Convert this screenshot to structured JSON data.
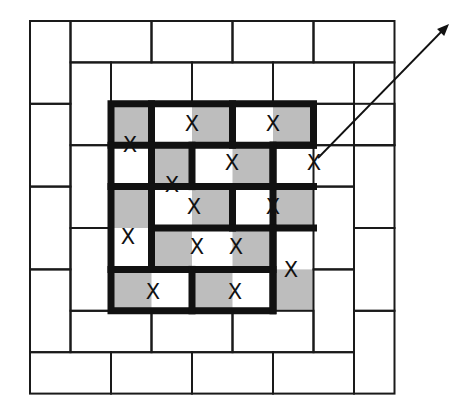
{
  "diagram": {
    "grid": {
      "origin_x": 30,
      "origin_y": 21,
      "unit_x": 40.5,
      "unit_y": 41.4,
      "cols": 9,
      "rows": 9
    },
    "colors": {
      "line": "#1a1a1a",
      "thick_line": "#111111",
      "shade": "#bdbdbd",
      "background": "#ffffff"
    },
    "mark_label": "X",
    "outer_dominoes": [
      [
        0,
        0,
        1,
        2
      ],
      [
        1,
        0,
        3,
        1
      ],
      [
        3,
        0,
        5,
        1
      ],
      [
        5,
        0,
        7,
        1
      ],
      [
        7,
        0,
        9,
        1
      ],
      [
        0,
        2,
        1,
        4
      ],
      [
        0,
        4,
        1,
        6
      ],
      [
        0,
        6,
        1,
        8
      ],
      [
        0,
        8,
        2,
        9
      ],
      [
        2,
        8,
        4,
        9
      ],
      [
        4,
        8,
        6,
        9
      ],
      [
        6,
        8,
        8,
        9
      ],
      [
        8,
        1,
        9,
        3
      ],
      [
        8,
        3,
        9,
        5
      ],
      [
        8,
        5,
        9,
        7
      ],
      [
        8,
        7,
        9,
        9
      ],
      [
        1,
        1,
        2,
        3
      ],
      [
        1,
        3,
        2,
        5
      ],
      [
        1,
        5,
        2,
        7
      ],
      [
        2,
        1,
        4,
        2
      ],
      [
        4,
        1,
        6,
        2
      ],
      [
        6,
        1,
        8,
        2
      ],
      [
        7,
        2,
        9,
        3
      ],
      [
        7,
        3,
        8,
        4
      ],
      [
        7,
        4,
        8,
        6
      ],
      [
        7,
        6,
        8,
        8
      ],
      [
        1,
        7,
        3,
        8
      ],
      [
        3,
        7,
        5,
        8
      ],
      [
        5,
        7,
        7,
        8
      ]
    ],
    "shaded_cells": [
      [
        2,
        2
      ],
      [
        4,
        2
      ],
      [
        6,
        2
      ],
      [
        3,
        3
      ],
      [
        5,
        3
      ],
      [
        2,
        4
      ],
      [
        4,
        4
      ],
      [
        6,
        4
      ],
      [
        3,
        5
      ],
      [
        5,
        5
      ],
      [
        2,
        6
      ],
      [
        4,
        6
      ],
      [
        6,
        6
      ]
    ],
    "thick_outline": [
      [
        2,
        2
      ],
      [
        7,
        2
      ],
      [
        7,
        3
      ],
      [
        6,
        3
      ],
      [
        6,
        7
      ],
      [
        2,
        7
      ],
      [
        2,
        2
      ]
    ],
    "thick_segments": [
      [
        [
          3,
          2
        ],
        [
          3,
          4
        ]
      ],
      [
        [
          5,
          2
        ],
        [
          5,
          3
        ]
      ],
      [
        [
          2,
          3
        ],
        [
          3,
          3
        ]
      ],
      [
        [
          3,
          3
        ],
        [
          7,
          3
        ]
      ],
      [
        [
          4,
          3
        ],
        [
          4,
          4
        ]
      ],
      [
        [
          6,
          3
        ],
        [
          6,
          4
        ]
      ],
      [
        [
          2,
          4
        ],
        [
          3,
          4
        ]
      ],
      [
        [
          3,
          4
        ],
        [
          7,
          4
        ]
      ],
      [
        [
          5,
          4
        ],
        [
          5,
          5
        ]
      ],
      [
        [
          3,
          4
        ],
        [
          3,
          6
        ]
      ],
      [
        [
          3,
          5
        ],
        [
          7,
          5
        ]
      ],
      [
        [
          2,
          6
        ],
        [
          6,
          6
        ]
      ],
      [
        [
          6,
          5
        ],
        [
          6,
          7
        ]
      ],
      [
        [
          4,
          6
        ],
        [
          4,
          7
        ]
      ]
    ],
    "marks": [
      {
        "x": 130,
        "y": 145
      },
      {
        "x": 192,
        "y": 124
      },
      {
        "x": 273,
        "y": 124
      },
      {
        "x": 172,
        "y": 185
      },
      {
        "x": 232,
        "y": 163
      },
      {
        "x": 314,
        "y": 163
      },
      {
        "x": 194,
        "y": 207
      },
      {
        "x": 273,
        "y": 207
      },
      {
        "x": 128,
        "y": 237
      },
      {
        "x": 197,
        "y": 247
      },
      {
        "x": 236,
        "y": 247
      },
      {
        "x": 291,
        "y": 270
      },
      {
        "x": 153,
        "y": 292
      },
      {
        "x": 235,
        "y": 292
      }
    ],
    "arrow": {
      "x1": 318,
      "y1": 158,
      "x2": 449,
      "y2": 24
    }
  }
}
